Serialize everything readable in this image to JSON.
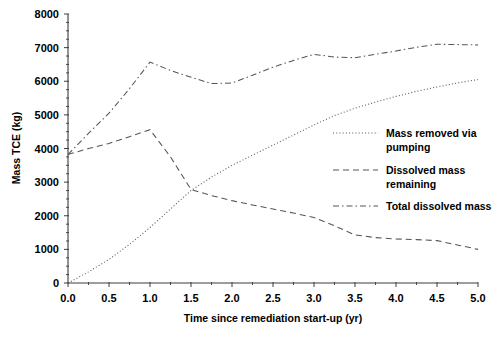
{
  "chart_data": {
    "type": "line",
    "title": "",
    "xlabel": "Time since remediation start-up (yr)",
    "ylabel": "Mass TCE (kg)",
    "xlim": [
      0.0,
      5.0
    ],
    "ylim": [
      0,
      8000
    ],
    "grid": false,
    "legend_position": "right-middle",
    "xticks": [
      "0.0",
      "0.5",
      "1.0",
      "1.5",
      "2.0",
      "2.5",
      "3.0",
      "3.5",
      "4.0",
      "4.5",
      "5.0"
    ],
    "xtick_values": [
      0.0,
      0.5,
      1.0,
      1.5,
      2.0,
      2.5,
      3.0,
      3.5,
      4.0,
      4.5,
      5.0
    ],
    "x_minor_interval": 0.25,
    "yticks": [
      "0",
      "1000",
      "2000",
      "3000",
      "4000",
      "5000",
      "6000",
      "7000",
      "8000"
    ],
    "ytick_values": [
      0,
      1000,
      2000,
      3000,
      4000,
      5000,
      6000,
      7000,
      8000
    ],
    "y_minor_interval": 250,
    "x": [
      0.0,
      0.25,
      0.5,
      0.75,
      1.0,
      1.25,
      1.5,
      1.75,
      2.0,
      2.25,
      2.5,
      2.75,
      3.0,
      3.25,
      3.5,
      3.75,
      4.0,
      4.25,
      4.5,
      4.75,
      5.0
    ],
    "series": [
      {
        "name": "Mass removed via pumping",
        "line_style": "dotted",
        "color": "#555555",
        "values": [
          0,
          330,
          700,
          1150,
          1650,
          2200,
          2750,
          3150,
          3500,
          3800,
          4100,
          4400,
          4700,
          4980,
          5200,
          5380,
          5550,
          5700,
          5830,
          5950,
          6050
        ]
      },
      {
        "name": "Dissolved mass remaining",
        "line_style": "dashed",
        "color": "#555555",
        "values": [
          3820,
          4000,
          4150,
          4350,
          4560,
          3750,
          2780,
          2600,
          2450,
          2320,
          2200,
          2080,
          1950,
          1700,
          1430,
          1350,
          1310,
          1290,
          1260,
          1130,
          1000
        ]
      },
      {
        "name": "Total dissolved mass",
        "line_style": "dash-dot",
        "color": "#555555",
        "values": [
          3820,
          4450,
          5050,
          5780,
          6570,
          6320,
          6120,
          5930,
          5950,
          6180,
          6420,
          6620,
          6800,
          6720,
          6700,
          6800,
          6900,
          7010,
          7100,
          7090,
          7080
        ]
      }
    ]
  },
  "legend": {
    "entries": [
      {
        "label_line1": "Mass removed via",
        "label_line2": "pumping",
        "style": "dotted"
      },
      {
        "label_line1": "Dissolved mass",
        "label_line2": "remaining",
        "style": "dashed"
      },
      {
        "label_line1": "Total dissolved mass",
        "label_line2": "",
        "style": "dash-dot"
      }
    ]
  },
  "colors": {
    "background": "#ffffff",
    "axis": "#3c3c3c",
    "line": "#555555",
    "text": "#000000"
  }
}
